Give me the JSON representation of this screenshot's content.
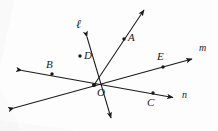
{
  "figure": {
    "kind": "geometry-diagram",
    "ink_color": "#1b1b1b",
    "paper_color": "#fdfdfd",
    "width": 218,
    "height": 131
  },
  "points": [
    {
      "id": "A",
      "label": "A",
      "dot": {
        "x": 124,
        "y": 39
      },
      "label_pos": {
        "x": 128,
        "y": 34
      }
    },
    {
      "id": "B",
      "label": "B",
      "dot": {
        "x": 52,
        "y": 74
      },
      "label_pos": {
        "x": 47,
        "y": 61
      }
    },
    {
      "id": "C",
      "label": "C",
      "dot": {
        "x": 153,
        "y": 93
      },
      "label_pos": {
        "x": 148,
        "y": 98
      }
    },
    {
      "id": "D",
      "label": "D",
      "dot": {
        "x": 80,
        "y": 56
      },
      "label_pos": {
        "x": 84,
        "y": 52
      }
    },
    {
      "id": "E",
      "label": "E",
      "dot": {
        "x": 163,
        "y": 67
      },
      "label_pos": {
        "x": 158,
        "y": 53
      }
    },
    {
      "id": "O",
      "label": "O",
      "dot": {
        "x": 94,
        "y": 85
      },
      "label_pos": {
        "x": 98,
        "y": 88
      }
    }
  ],
  "lines": [
    {
      "id": "ell",
      "label": "ℓ",
      "label_pos": {
        "x": 78,
        "y": 22
      },
      "from": {
        "x": 86,
        "y": 34
      },
      "to": {
        "x": 112,
        "y": 121
      },
      "arrow_start": true,
      "arrow_end": true
    },
    {
      "id": "m",
      "label": "m",
      "label_pos": {
        "x": 200,
        "y": 45
      },
      "from": {
        "x": 11,
        "y": 109
      },
      "to": {
        "x": 195,
        "y": 58
      },
      "arrow_start": true,
      "arrow_end": true
    },
    {
      "id": "n",
      "label": "n",
      "label_pos": {
        "x": 183,
        "y": 92
      },
      "from": {
        "x": 19,
        "y": 70
      },
      "to": {
        "x": 176,
        "y": 98
      },
      "arrow_start": true,
      "arrow_end": true
    }
  ],
  "rays": [
    {
      "id": "OA",
      "from": {
        "x": 94,
        "y": 85
      },
      "to": {
        "x": 147,
        "y": 6
      },
      "arrow_end": true
    }
  ]
}
